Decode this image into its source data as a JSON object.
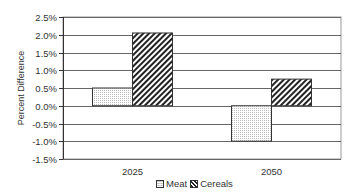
{
  "chart_data": {
    "type": "bar",
    "title": "",
    "xlabel": "",
    "ylabel": "Percent Difference",
    "categories": [
      "2025",
      "2050"
    ],
    "series": [
      {
        "name": "Meat",
        "values": [
          0.5,
          -1.0
        ],
        "pattern": "dotted"
      },
      {
        "name": "Cereals",
        "values": [
          2.05,
          0.75
        ],
        "pattern": "diagonal-hatch"
      }
    ],
    "ylim": [
      -1.5,
      2.5
    ],
    "yticks": [
      2.5,
      2.0,
      1.5,
      1.0,
      0.5,
      0.0,
      -0.5,
      -1.0,
      -1.5
    ],
    "ytick_labels": [
      "2.5%",
      "2.0%",
      "1.5%",
      "1.0%",
      "0.5%",
      "0.0%",
      "-0.5%",
      "-1.0%",
      "-1.5%"
    ],
    "grid": true,
    "legend_position": "bottom"
  },
  "legend": {
    "meat_label": "Meat",
    "cereals_label": "Cereals"
  },
  "colors": {
    "gridline": "#666666",
    "bar_outline": "#333333",
    "hatch": "#222222",
    "dots": "#bbbbbb"
  }
}
